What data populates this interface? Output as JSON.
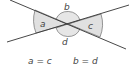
{
  "diagram": {
    "angle_labels": {
      "a": "a",
      "b": "b",
      "c": "c",
      "d": "d"
    },
    "equations": {
      "left": "a = c",
      "right": "b = d"
    },
    "colors": {
      "line": "#333333",
      "shade": "#d9d9d9",
      "text": "#444444"
    }
  }
}
